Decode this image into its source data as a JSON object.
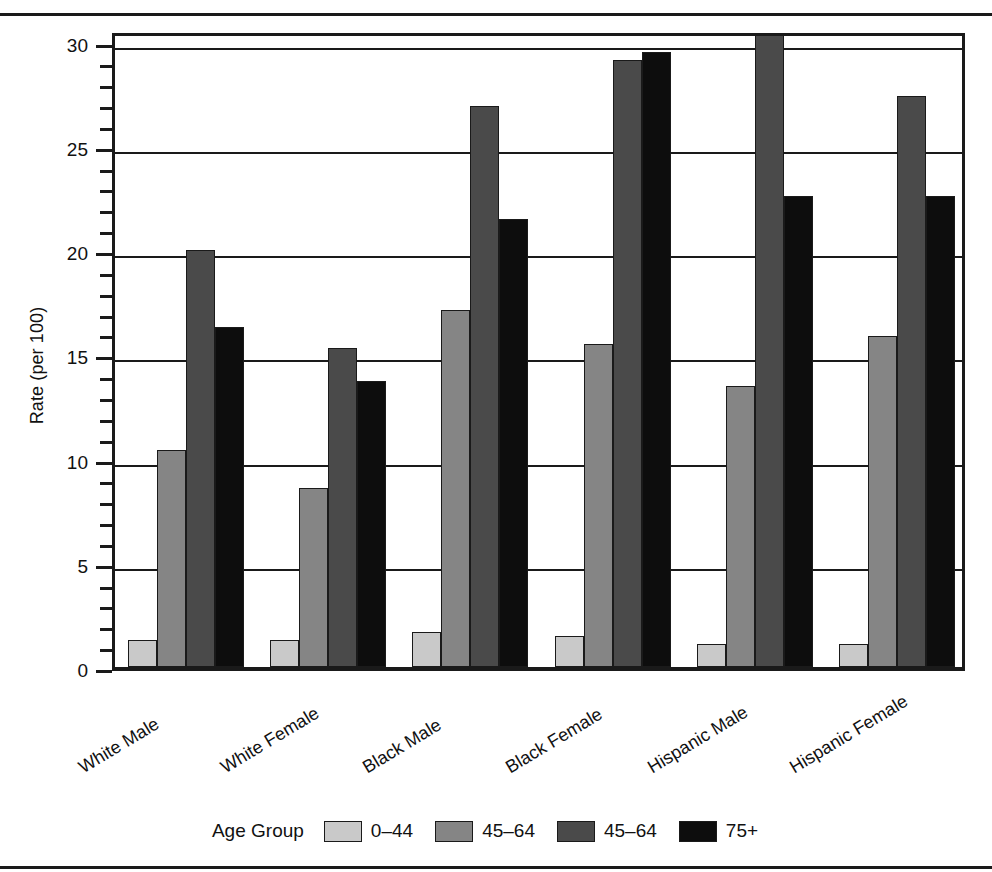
{
  "chart_data": {
    "type": "bar",
    "title": "",
    "subtitle": "",
    "xlabel": "",
    "ylabel": "Rate (per 100)",
    "ylim": [
      0,
      30.6
    ],
    "ytick_values": [
      0,
      5,
      10,
      15,
      20,
      25,
      30
    ],
    "ytick_labels": [
      "0",
      "5",
      "10",
      "15",
      "20",
      "25",
      "30"
    ],
    "yminor_step": 1,
    "grid": "horizontal",
    "legend_position": "bottom",
    "legend_title": "Age Group",
    "categories": [
      "White Male",
      "White Female",
      "Black Male",
      "Black Female",
      "Hispanic Male",
      "Hispanic Female"
    ],
    "series": [
      {
        "name": "0–44",
        "color": "#c9c9c9",
        "values": [
          1.3,
          1.3,
          1.7,
          1.5,
          1.1,
          1.1
        ]
      },
      {
        "name": "45–64",
        "color": "#858585",
        "values": [
          10.4,
          8.6,
          17.1,
          15.5,
          13.5,
          15.9
        ]
      },
      {
        "name": "45–64",
        "color": "#4a4a4a",
        "values": [
          20.0,
          15.3,
          26.9,
          29.1,
          30.4,
          27.4
        ]
      },
      {
        "name": "75+",
        "color": "#0d0d0d",
        "values": [
          16.3,
          13.7,
          21.5,
          29.5,
          22.6,
          22.6
        ]
      }
    ]
  },
  "axis": {
    "y_title": "Rate (per 100)"
  },
  "legend": {
    "title": "Age Group",
    "items": [
      {
        "label": "0–44",
        "color": "#c9c9c9"
      },
      {
        "label": "45–64",
        "color": "#858585"
      },
      {
        "label": "45–64",
        "color": "#4a4a4a"
      },
      {
        "label": "75+",
        "color": "#0d0d0d"
      }
    ]
  }
}
